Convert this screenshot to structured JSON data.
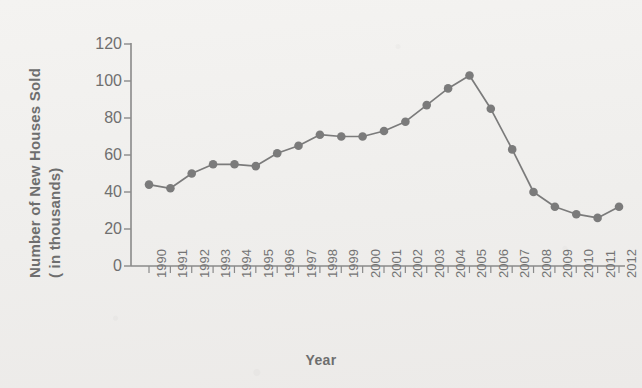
{
  "chart_data": {
    "type": "line",
    "title": "",
    "xlabel": "Year",
    "ylabel": "Number of New Houses Sold ( in thousands)",
    "ylabel_line1": "Number of New Houses Sold",
    "ylabel_line2": "( in thousands)",
    "categories": [
      "1990",
      "1991",
      "1992",
      "1993",
      "1994",
      "1995",
      "1996",
      "1997",
      "1998",
      "1999",
      "2000",
      "2001",
      "2002",
      "2003",
      "2004",
      "2005",
      "2006",
      "2007",
      "2008",
      "2009",
      "2010",
      "2011",
      "2012"
    ],
    "values": [
      44,
      42,
      50,
      55,
      55,
      54,
      61,
      65,
      71,
      70,
      70,
      73,
      78,
      87,
      96,
      103,
      85,
      63,
      40,
      32,
      28,
      26,
      32
    ],
    "ylim": [
      0,
      120
    ],
    "yticks": [
      0,
      20,
      40,
      60,
      80,
      100,
      120
    ],
    "ytick_labels": [
      "0",
      "20",
      "40",
      "60",
      "80",
      "100",
      "120"
    ],
    "grid": false,
    "legend": "none",
    "series_color": "#7b7b7b",
    "marker": "circle",
    "axis_color": "#8a8a8a",
    "text_color": "#6e6e6e",
    "background_color": "#f1f0ee"
  }
}
